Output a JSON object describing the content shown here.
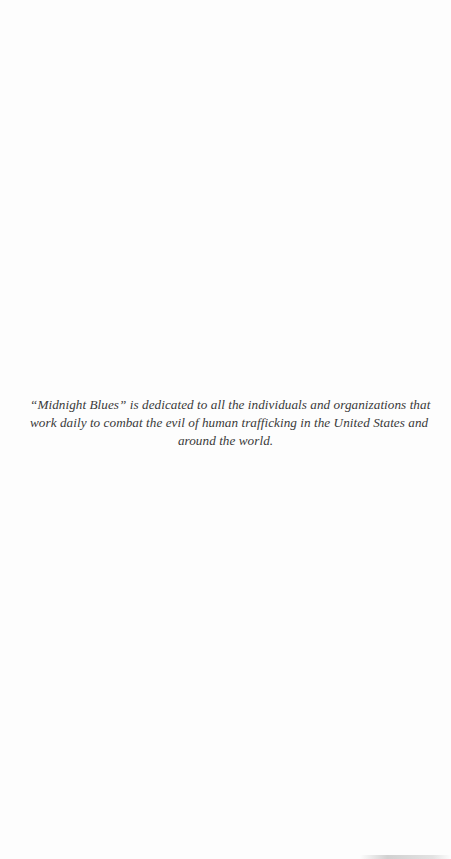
{
  "document": {
    "type": "dedication-page",
    "dedication_lines": [
      "“Midnight Blues” is dedicated to all the individuals and organizations that",
      "work daily to combat the evil of  human trafficking in the United States and",
      "around the world."
    ]
  }
}
